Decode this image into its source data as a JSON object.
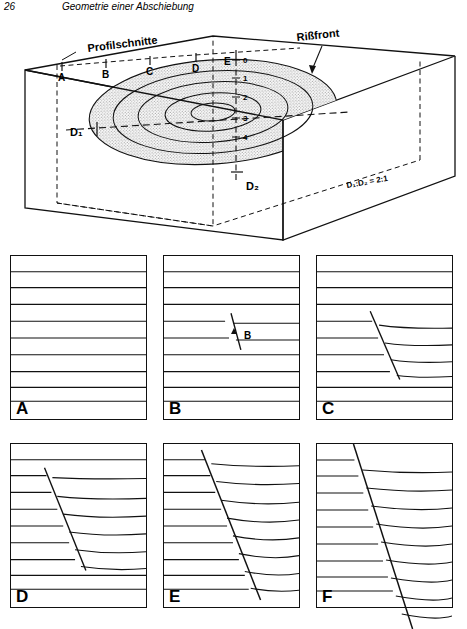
{
  "header": {
    "page_number": "26",
    "running_title": "Geometrie einer Abschiebung"
  },
  "block_diagram": {
    "labels": {
      "profile_traces": "Profilschnitte",
      "fault_tip_line": "Rißfront",
      "long_axis": "D₁",
      "short_axis": "D₂",
      "axial_ratio": "D₁:D₂ = 2:1"
    },
    "section_markers": [
      "A",
      "B",
      "C",
      "D",
      "E"
    ],
    "contour_values": [
      "0",
      "1",
      "2",
      "3",
      "4"
    ]
  },
  "profiles": [
    {
      "id": "A",
      "tag": "A",
      "inner_label": "",
      "fault_offset": 0,
      "description": "undeformed horizontal layering, no fault"
    },
    {
      "id": "B",
      "tag": "B",
      "inner_label": "B",
      "fault_offset": 1,
      "description": "short fault segment, minimal offset"
    },
    {
      "id": "C",
      "tag": "C",
      "inner_label": "",
      "fault_offset": 2,
      "description": "fault with small visible offset and drag"
    },
    {
      "id": "D",
      "tag": "D",
      "inner_label": "",
      "fault_offset": 3,
      "description": "longer fault, moderate offset"
    },
    {
      "id": "E",
      "tag": "E",
      "inner_label": "",
      "fault_offset": 4,
      "description": "fault spans full height, pronounced drag folding"
    },
    {
      "id": "F",
      "tag": "F",
      "inner_label": "",
      "fault_offset": 5,
      "description": "maximum displacement, fault cuts beyond section"
    }
  ],
  "style": {
    "line_color": "#111111",
    "stipple_color": "#9a9a9a",
    "background": "#ffffff"
  }
}
